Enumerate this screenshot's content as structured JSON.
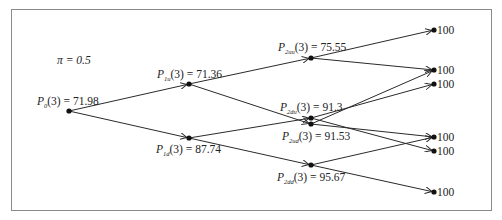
{
  "diagram": {
    "type": "binomial-tree",
    "probability_label": "π = 0.5",
    "colors": {
      "line": "#2a2a2a",
      "node": "#111111",
      "frame": "#8a8a8a"
    },
    "nodes": [
      {
        "id": "P0",
        "label_sym": "P",
        "label_sub": "0",
        "label_rest": "(3) = 71.98",
        "value": 71.98
      },
      {
        "id": "P1u",
        "label_sym": "P",
        "label_sub": "1u",
        "label_rest": "(3) = 71.36",
        "value": 71.36
      },
      {
        "id": "P1d",
        "label_sym": "P",
        "label_sub": "1d",
        "label_rest": "(3) = 87.74",
        "value": 87.74
      },
      {
        "id": "P2uu",
        "label_sym": "P",
        "label_sub": "2uu",
        "label_rest": "(3) = 75.55",
        "value": 75.55
      },
      {
        "id": "P2du",
        "label_sym": "P",
        "label_sub": "2du",
        "label_rest": "(3) = 91.3",
        "value": 91.3
      },
      {
        "id": "P2ud",
        "label_sym": "P",
        "label_sub": "2ud",
        "label_rest": "(3) = 91.53",
        "value": 91.53
      },
      {
        "id": "P2dd",
        "label_sym": "P",
        "label_sub": "2dd",
        "label_rest": "(3) = 95.67",
        "value": 95.67
      }
    ],
    "terminals": [
      {
        "id": "T1",
        "label": "100"
      },
      {
        "id": "T2",
        "label": "100"
      },
      {
        "id": "T3",
        "label": "100"
      },
      {
        "id": "T4",
        "label": "100"
      },
      {
        "id": "T5",
        "label": "100"
      },
      {
        "id": "T6",
        "label": "100"
      }
    ],
    "edges": [
      [
        "P0",
        "P1u"
      ],
      [
        "P0",
        "P1d"
      ],
      [
        "P1u",
        "P2uu"
      ],
      [
        "P1u",
        "P2ud"
      ],
      [
        "P1d",
        "P2du"
      ],
      [
        "P1d",
        "P2dd"
      ],
      [
        "P2uu",
        "T1"
      ],
      [
        "P2uu",
        "T2"
      ],
      [
        "P2ud",
        "T2"
      ],
      [
        "P2ud",
        "T4"
      ],
      [
        "P2du",
        "T3"
      ],
      [
        "P2du",
        "T5"
      ],
      [
        "P2dd",
        "T4"
      ],
      [
        "P2dd",
        "T6"
      ]
    ]
  }
}
